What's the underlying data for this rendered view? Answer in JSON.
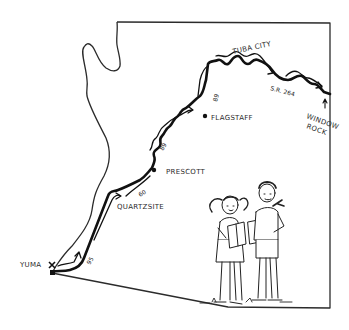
{
  "map": {
    "region": "Arizona",
    "style": "hand-drawn illustration",
    "colors": {
      "ink": "#1a1a1a",
      "background": "#ffffff",
      "border": "#333333"
    },
    "cities": [
      {
        "name": "YUMA",
        "marker": "x"
      },
      {
        "name": "QUARTZSITE"
      },
      {
        "name": "PRESCOTT"
      },
      {
        "name": "FLAGSTAFF"
      },
      {
        "name": "TUBA CITY"
      },
      {
        "name": "WINDOW ROCK",
        "line1": "WINDOW",
        "line2": "ROCK"
      }
    ],
    "routes": [
      {
        "label": "95"
      },
      {
        "label": "60"
      },
      {
        "label": "89"
      },
      {
        "label": "89"
      },
      {
        "label": "S.R. 264"
      }
    ],
    "illustration": "two children standing, holding open maps"
  }
}
